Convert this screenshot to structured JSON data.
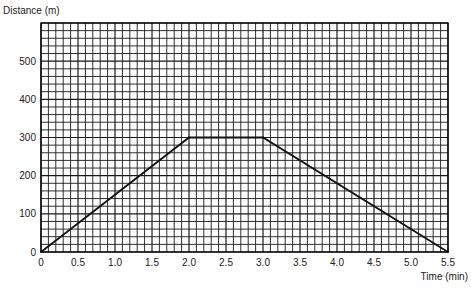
{
  "chart_data": {
    "type": "line",
    "title": "",
    "xlabel": "Time (min)",
    "ylabel": "Distance (m)",
    "xlim": [
      0,
      5.5
    ],
    "ylim": [
      0,
      600
    ],
    "x_ticks": [
      0,
      0.5,
      1.0,
      1.5,
      2.0,
      2.5,
      3.0,
      3.5,
      4.0,
      4.5,
      5.0,
      5.5
    ],
    "x_tick_labels": [
      "0",
      "0.5",
      "1.0",
      "1.5",
      "2.0",
      "2.5",
      "3.0",
      "3.5",
      "4.0",
      "4.5",
      "5.0",
      "5.5"
    ],
    "y_ticks": [
      0,
      100,
      200,
      300,
      400,
      500
    ],
    "y_tick_labels": [
      "0",
      "100",
      "200",
      "300",
      "400",
      "500"
    ],
    "grid": true,
    "x_minor_step": 0.1,
    "y_minor_step": 20,
    "series": [
      {
        "name": "distance",
        "x": [
          0,
          2.0,
          3.0,
          5.5
        ],
        "y": [
          0,
          300,
          300,
          0
        ]
      }
    ],
    "colors": {
      "line": "#111111",
      "grid": "#1a1a1a",
      "background": "#ffffff"
    }
  }
}
